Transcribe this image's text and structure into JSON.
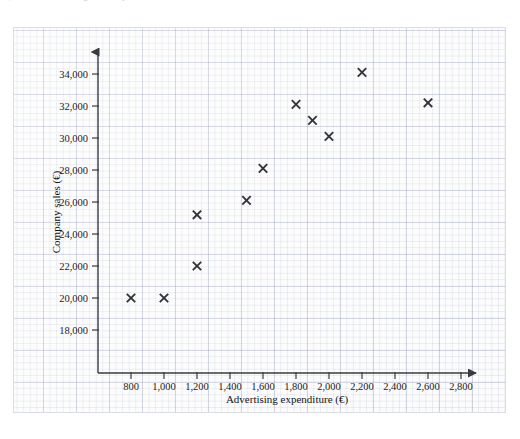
{
  "page": {
    "top_partial_text": "b)  Draw a scatter diagram to represent this information.",
    "background_color": "#ffffff",
    "paper_color": "#fcfcfd",
    "grid_color": "#7882a0",
    "ink_color": "#33333b"
  },
  "chart_data": {
    "type": "scatter",
    "title": "",
    "xlabel": "Advertising expenditure (€)",
    "ylabel": "Company sales (€)",
    "xlim": [
      600,
      2900
    ],
    "ylim": [
      17000,
      35200
    ],
    "xticks": [
      800,
      1000,
      1200,
      1400,
      1600,
      1800,
      2000,
      2200,
      2400,
      2600,
      2800
    ],
    "xticklabels": [
      "800",
      "1,000",
      "1,200",
      "1,400",
      "1,600",
      "1,800",
      "2,000",
      "2,200",
      "2,400",
      "2,600",
      "2,800"
    ],
    "yticks": [
      18000,
      20000,
      22000,
      24000,
      26000,
      28000,
      30000,
      32000,
      34000
    ],
    "yticklabels": [
      "18,000",
      "20,000",
      "22,000",
      "24,000",
      "26,000",
      "28,000",
      "30,000",
      "32,000",
      "34,000"
    ],
    "grid": true,
    "grid_style": "graph-paper",
    "legend": null,
    "marker": "x",
    "x": [
      800,
      1000,
      1200,
      1200,
      1500,
      1600,
      1800,
      1900,
      2000,
      2200,
      2600
    ],
    "y": [
      20000,
      20000,
      22000,
      25200,
      26100,
      28100,
      32100,
      31100,
      30100,
      34100,
      32200
    ],
    "points": [
      {
        "x": 800,
        "y": 20000
      },
      {
        "x": 1000,
        "y": 20000
      },
      {
        "x": 1200,
        "y": 22000
      },
      {
        "x": 1200,
        "y": 25200
      },
      {
        "x": 1500,
        "y": 26100
      },
      {
        "x": 1600,
        "y": 28100
      },
      {
        "x": 1800,
        "y": 32100
      },
      {
        "x": 1900,
        "y": 31100
      },
      {
        "x": 2000,
        "y": 30100
      },
      {
        "x": 2200,
        "y": 34100
      },
      {
        "x": 2600,
        "y": 32200
      }
    ]
  }
}
